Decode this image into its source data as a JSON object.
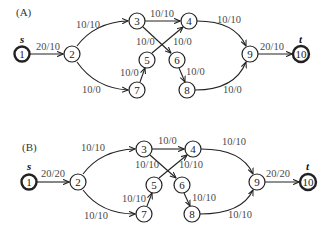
{
  "figure": {
    "panels": [
      {
        "id": "A",
        "label": "(A)",
        "source_label": "s",
        "sink_label": "t",
        "nodes": [
          {
            "id": "1",
            "label": "1",
            "x": 22,
            "y": 54,
            "terminal": true
          },
          {
            "id": "2",
            "label": "2",
            "x": 72,
            "y": 54
          },
          {
            "id": "3",
            "label": "3",
            "x": 137,
            "y": 21
          },
          {
            "id": "4",
            "label": "4",
            "x": 189,
            "y": 21
          },
          {
            "id": "5",
            "label": "5",
            "x": 147,
            "y": 60
          },
          {
            "id": "6",
            "label": "6",
            "x": 177,
            "y": 60
          },
          {
            "id": "7",
            "label": "7",
            "x": 137,
            "y": 90
          },
          {
            "id": "8",
            "label": "8",
            "x": 187,
            "y": 90
          },
          {
            "id": "9",
            "label": "9",
            "x": 250,
            "y": 54
          },
          {
            "id": "10",
            "label": "10",
            "x": 301,
            "y": 54,
            "terminal": true
          }
        ],
        "edges": [
          {
            "from": "1",
            "to": "2",
            "label": "20/10"
          },
          {
            "from": "2",
            "to": "3",
            "label": "10/10"
          },
          {
            "from": "2",
            "to": "7",
            "label": "10/0"
          },
          {
            "from": "3",
            "to": "4",
            "label": "10/10"
          },
          {
            "from": "3",
            "to": "6",
            "label": "10/0"
          },
          {
            "from": "5",
            "to": "4",
            "label": "10/0"
          },
          {
            "from": "7",
            "to": "5",
            "label": "10/0"
          },
          {
            "from": "6",
            "to": "8",
            "label": "10/0"
          },
          {
            "from": "4",
            "to": "9",
            "label": "10/10"
          },
          {
            "from": "8",
            "to": "9",
            "label": "10/0"
          },
          {
            "from": "9",
            "to": "10",
            "label": "20/10"
          }
        ]
      },
      {
        "id": "B",
        "label": "(B)",
        "source_label": "s",
        "sink_label": "t",
        "nodes": [
          {
            "id": "1",
            "label": "1",
            "x": 29,
            "y": 182,
            "terminal": true
          },
          {
            "id": "2",
            "label": "2",
            "x": 78,
            "y": 182
          },
          {
            "id": "3",
            "label": "3",
            "x": 144,
            "y": 149
          },
          {
            "id": "4",
            "label": "4",
            "x": 193,
            "y": 149
          },
          {
            "id": "5",
            "label": "5",
            "x": 154,
            "y": 185
          },
          {
            "id": "6",
            "label": "6",
            "x": 182,
            "y": 185
          },
          {
            "id": "7",
            "label": "7",
            "x": 144,
            "y": 214
          },
          {
            "id": "8",
            "label": "8",
            "x": 192,
            "y": 214
          },
          {
            "id": "9",
            "label": "9",
            "x": 257,
            "y": 182
          },
          {
            "id": "10",
            "label": "10",
            "x": 308,
            "y": 182,
            "terminal": true
          }
        ],
        "edges": [
          {
            "from": "1",
            "to": "2",
            "label": "20/20"
          },
          {
            "from": "2",
            "to": "3",
            "label": "10/10"
          },
          {
            "from": "2",
            "to": "7",
            "label": "10/10"
          },
          {
            "from": "3",
            "to": "4",
            "label": "10/0"
          },
          {
            "from": "3",
            "to": "6",
            "label": "10/10"
          },
          {
            "from": "5",
            "to": "4",
            "label": "10/10"
          },
          {
            "from": "7",
            "to": "5",
            "label": "10/10"
          },
          {
            "from": "6",
            "to": "8",
            "label": "10/10"
          },
          {
            "from": "4",
            "to": "9",
            "label": "10/10"
          },
          {
            "from": "8",
            "to": "9",
            "label": "10/10"
          },
          {
            "from": "9",
            "to": "10",
            "label": "20/20"
          }
        ]
      }
    ]
  }
}
